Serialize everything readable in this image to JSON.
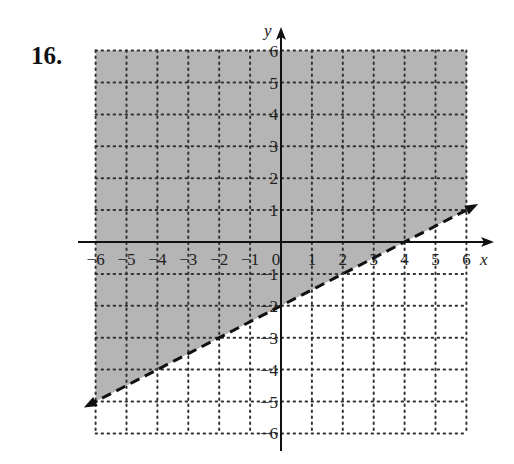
{
  "problem": {
    "number": "16."
  },
  "colors": {
    "shade": "#b5b5b5",
    "grid": "#333333",
    "axis": "#111111",
    "boundary": "#111111",
    "background": "#ffffff"
  },
  "chart_data": {
    "type": "inequality-graph",
    "title": "16.",
    "xlabel": "x",
    "ylabel": "y",
    "xlim": [
      -6,
      6
    ],
    "ylim": [
      -6,
      6
    ],
    "grid": true,
    "grid_style": "dotted",
    "x_ticks": [
      "-6",
      "-5",
      "-4",
      "-3",
      "-2",
      "-1",
      "0",
      "1",
      "2",
      "3",
      "4",
      "5",
      "6"
    ],
    "y_ticks": [
      "-6",
      "-5",
      "-4",
      "-3",
      "-2",
      "-1",
      "1",
      "2",
      "3",
      "4",
      "5",
      "6"
    ],
    "boundary_line": {
      "equation": "y = 0.5x - 2",
      "slope": 0.5,
      "intercept": -2,
      "style": "dashed",
      "points": [
        [
          -6,
          -5
        ],
        [
          0,
          -2
        ],
        [
          2,
          -1
        ],
        [
          4,
          0
        ],
        [
          6,
          1
        ]
      ]
    },
    "inequality": "y > 0.5x - 2",
    "shaded_region": "above the line"
  }
}
